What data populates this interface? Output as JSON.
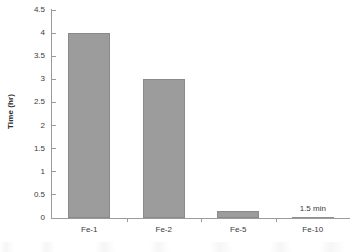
{
  "chart_data": {
    "type": "bar",
    "title": "",
    "xlabel": "",
    "ylabel": "Time (hr)",
    "categories": [
      "Fe-1",
      "Fe-2",
      "Fe-5",
      "Fe-10"
    ],
    "values": [
      4.0,
      3.0,
      0.15,
      0.025
    ],
    "ylim": [
      0,
      4.5
    ],
    "ytick_labels": [
      "0",
      "0.5",
      "1",
      "1.5",
      "2",
      "2.5",
      "3",
      "3.5",
      "4",
      "4.5"
    ],
    "ytick_values": [
      0,
      0.5,
      1,
      1.5,
      2,
      2.5,
      3,
      3.5,
      4,
      4.5
    ],
    "grid": false,
    "legend": "none",
    "annotations": [
      {
        "text": "1.5 min",
        "category": "Fe-10",
        "series_index": 3
      }
    ],
    "bar_color": "#9c9c9c",
    "bar_border_color": "#8a8a8a",
    "axis_color": "#9b9b9b",
    "text_color": "#3a3a3a"
  }
}
